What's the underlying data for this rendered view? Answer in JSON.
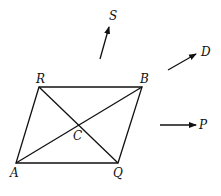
{
  "diagram": {
    "points": {
      "A": {
        "label": "A",
        "x": 16,
        "y": 163
      },
      "Q": {
        "label": "Q",
        "x": 118,
        "y": 163
      },
      "B": {
        "label": "B",
        "x": 142,
        "y": 87
      },
      "R": {
        "label": "R",
        "x": 39,
        "y": 87
      },
      "C": {
        "label": "C",
        "x": 79,
        "y": 125
      }
    },
    "vectors": {
      "S": {
        "label": "S"
      },
      "D": {
        "label": "D"
      },
      "P": {
        "label": "P"
      }
    },
    "line_color": "#111111"
  }
}
